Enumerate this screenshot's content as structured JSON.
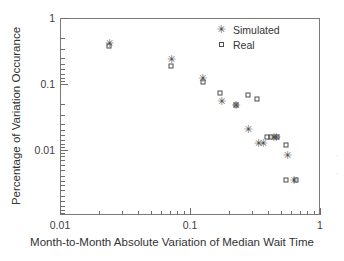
{
  "chart_data": {
    "type": "scatter",
    "title": "",
    "xlabel": "Month-to-Month Absolute Variation of Median Wait Time",
    "ylabel": "Percentage of Variation Occurance",
    "xscale": "log",
    "yscale": "log",
    "xlim": [
      0.01,
      1.0
    ],
    "ylim": [
      0.0017,
      1.0
    ],
    "grid": false,
    "legend_position": "top-right",
    "xticks": [
      0.01,
      0.1,
      1
    ],
    "xticklabels": [
      "0.01",
      "0.1",
      "1"
    ],
    "yticks": [
      0.01,
      0.1,
      1
    ],
    "yticklabels": [
      "0.01",
      "0.1",
      "1"
    ],
    "series": [
      {
        "name": "Simulated",
        "marker": "star-asterisk",
        "color": "#4a4a4a",
        "points": [
          {
            "x": 0.024,
            "y": 0.42
          },
          {
            "x": 0.072,
            "y": 0.24
          },
          {
            "x": 0.125,
            "y": 0.122
          },
          {
            "x": 0.175,
            "y": 0.055
          },
          {
            "x": 0.225,
            "y": 0.048
          },
          {
            "x": 0.28,
            "y": 0.021
          },
          {
            "x": 0.335,
            "y": 0.0128
          },
          {
            "x": 0.365,
            "y": 0.0128
          },
          {
            "x": 0.44,
            "y": 0.016
          },
          {
            "x": 0.46,
            "y": 0.016
          },
          {
            "x": 0.56,
            "y": 0.0084
          },
          {
            "x": 0.63,
            "y": 0.0035
          }
        ]
      },
      {
        "name": "Real",
        "marker": "open-square",
        "color": "#4d4d4d",
        "points": [
          {
            "x": 0.024,
            "y": 0.37
          },
          {
            "x": 0.072,
            "y": 0.19
          },
          {
            "x": 0.125,
            "y": 0.108
          },
          {
            "x": 0.17,
            "y": 0.072
          },
          {
            "x": 0.225,
            "y": 0.048
          },
          {
            "x": 0.28,
            "y": 0.067
          },
          {
            "x": 0.33,
            "y": 0.06
          },
          {
            "x": 0.39,
            "y": 0.0155
          },
          {
            "x": 0.42,
            "y": 0.016
          },
          {
            "x": 0.47,
            "y": 0.016
          },
          {
            "x": 0.55,
            "y": 0.0118
          },
          {
            "x": 0.55,
            "y": 0.0035
          },
          {
            "x": 0.65,
            "y": 0.0035
          }
        ]
      }
    ],
    "legend": [
      {
        "label": "Simulated",
        "marker": "star-asterisk"
      },
      {
        "label": "Real",
        "marker": "open-square"
      }
    ]
  },
  "axes": {
    "x_title": "Month-to-Month Absolute Variation of Median Wait Time",
    "y_title": "Percentage of Variation Occurance",
    "x_tick_labels": [
      "0.01",
      "0.1",
      "1"
    ],
    "y_tick_labels": [
      "1",
      "0.1",
      "0.01"
    ]
  },
  "legend": {
    "simulated_label": "Simulated",
    "real_label": "Real"
  },
  "symbols": {
    "star": "✳"
  }
}
